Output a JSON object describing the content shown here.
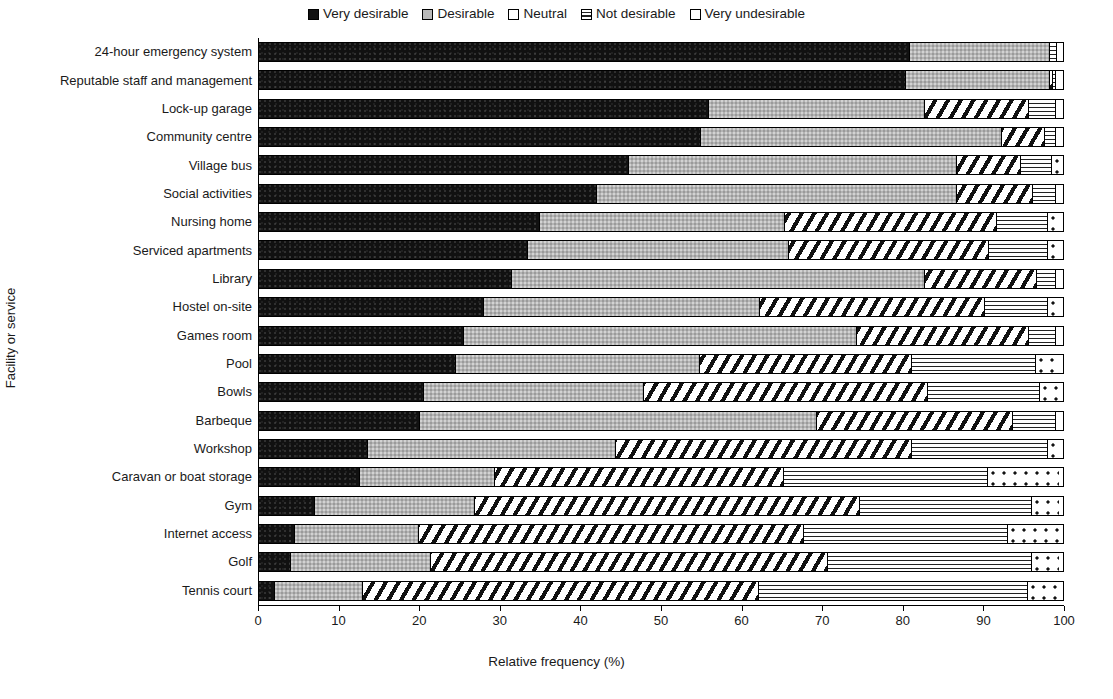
{
  "legend": {
    "position": "top-center",
    "items": [
      {
        "label": "Very desirable",
        "key": "very_desirable",
        "pattern": "solid-black",
        "color": "#111111"
      },
      {
        "label": "Desirable",
        "key": "desirable",
        "pattern": "solid-gray",
        "color": "#b4b4b4"
      },
      {
        "label": "Neutral",
        "key": "neutral",
        "pattern": "diagonal-hatch",
        "color": "#ffffff"
      },
      {
        "label": "Not desirable",
        "key": "not_desirable",
        "pattern": "horizontal-lines",
        "color": "#ffffff"
      },
      {
        "label": "Very undesirable",
        "key": "very_undesirable",
        "pattern": "dotted",
        "color": "#ffffff"
      }
    ]
  },
  "axes": {
    "x_title": "Relative frequency (%)",
    "y_title": "Facility or service",
    "x_ticks": [
      "0",
      "10",
      "20",
      "30",
      "40",
      "50",
      "60",
      "70",
      "80",
      "90",
      "100"
    ],
    "x_min": 0,
    "x_max": 100
  },
  "chart_data": {
    "type": "bar",
    "orientation": "horizontal",
    "stacked": true,
    "normalized": true,
    "title": "",
    "xlabel": "Relative frequency (%)",
    "ylabel": "Facility or service",
    "xlim": [
      0,
      100
    ],
    "grid": false,
    "legend_position": "top-center",
    "series": [
      {
        "name": "Very desirable",
        "values": [
          81.0,
          80.5,
          56.0,
          55.0,
          46.0,
          42.0,
          35.0,
          33.5,
          31.5,
          28.0,
          25.5,
          24.5,
          20.5,
          20.0,
          13.5,
          12.5,
          7.0,
          4.5,
          4.0,
          2.0
        ]
      },
      {
        "name": "Desirable",
        "values": [
          17.5,
          18.0,
          27.0,
          37.5,
          41.0,
          45.0,
          30.5,
          32.5,
          51.5,
          34.5,
          49.0,
          30.5,
          27.5,
          49.5,
          31.0,
          17.0,
          20.0,
          15.5,
          17.5,
          11.0
        ]
      },
      {
        "name": "Neutral",
        "values": [
          0.0,
          0.5,
          13.0,
          5.5,
          8.0,
          9.5,
          26.5,
          25.0,
          14.0,
          28.0,
          21.5,
          26.5,
          35.5,
          24.5,
          37.0,
          36.0,
          48.0,
          48.0,
          49.5,
          49.5
        ]
      },
      {
        "name": "Not desirable",
        "values": [
          1.0,
          0.5,
          3.5,
          1.5,
          4.0,
          3.0,
          6.5,
          7.5,
          2.5,
          8.0,
          3.5,
          15.5,
          14.0,
          5.5,
          17.0,
          25.5,
          21.5,
          25.5,
          25.5,
          33.5
        ]
      },
      {
        "name": "Very undesirable",
        "values": [
          0.5,
          0.5,
          0.5,
          0.5,
          1.0,
          0.5,
          1.5,
          1.5,
          0.5,
          1.5,
          0.5,
          3.0,
          2.5,
          0.5,
          1.5,
          9.0,
          3.5,
          6.5,
          3.5,
          4.0
        ]
      }
    ],
    "categories": [
      "24-hour emergency system",
      "Reputable staff and management",
      "Lock-up garage",
      "Community centre",
      "Village bus",
      "Social activities",
      "Nursing home",
      "Serviced apartments",
      "Library",
      "Hostel on-site",
      "Games room",
      "Pool",
      "Bowls",
      "Barbeque",
      "Workshop",
      "Caravan or boat storage",
      "Gym",
      "Internet access",
      "Golf",
      "Tennis court"
    ]
  }
}
